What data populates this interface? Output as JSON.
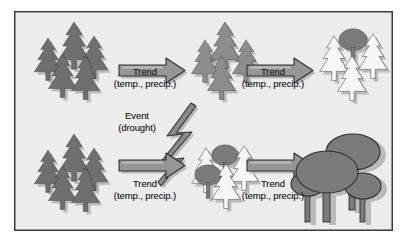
{
  "figure": {
    "panel_background": "#ececed",
    "border_color": "#3b3b3b"
  },
  "colors": {
    "dark_conifer": "#6f6f6f",
    "mid_conifer": "#8d8d8d",
    "white_conifer": "#f6f6f6",
    "deciduous": "#7b7b7b",
    "arrow": "#8f8f8f",
    "bolt": "#8a8a8a",
    "outline": "#2e2e2e",
    "shadow": "#b9b9b9",
    "text": "#1b1b1b"
  },
  "labels": {
    "trend_line1": "Trend",
    "trend_line2": "(temp., precip.)",
    "event_line1": "Event",
    "event_line2": "(drought)"
  },
  "arrows": [
    {
      "id": "arrow-top-left",
      "label_line1": "Trend",
      "label_line2": "(temp., precip.)"
    },
    {
      "id": "arrow-top-right",
      "label_line1": "Trend",
      "label_line2": "(temp., precip.)"
    },
    {
      "id": "arrow-bottom-left",
      "label_line1": "Trend",
      "label_line2": "(temp., precip.)"
    },
    {
      "id": "arrow-bottom-right",
      "label_line1": "Trend",
      "label_line2": "(temp., precip.)"
    }
  ],
  "stands": [
    {
      "id": "stand-top-left",
      "position": "top-left",
      "description": "dense dark conifer stand",
      "conifer_count": 5,
      "deciduous_count": 0,
      "shade": "dark"
    },
    {
      "id": "stand-top-middle",
      "position": "top-middle",
      "description": "conifer stand, lighter shade",
      "conifer_count": 4,
      "deciduous_count": 0,
      "shade": "mid"
    },
    {
      "id": "stand-top-right",
      "position": "top-right",
      "description": "white conifers with one deciduous tree",
      "conifer_count": 4,
      "deciduous_count": 1,
      "shade": "white"
    },
    {
      "id": "stand-bottom-left",
      "position": "bottom-left",
      "description": "dense dark conifer stand",
      "conifer_count": 5,
      "deciduous_count": 0,
      "shade": "dark"
    },
    {
      "id": "stand-bottom-middle",
      "position": "bottom-middle",
      "description": "white conifers with two deciduous trees",
      "conifer_count": 3,
      "deciduous_count": 2,
      "shade": "white"
    },
    {
      "id": "stand-bottom-right",
      "position": "bottom-right",
      "description": "deciduous broadleaf stand",
      "conifer_count": 0,
      "deciduous_count": 4,
      "shade": "deciduous"
    }
  ],
  "event": {
    "id": "drought-event",
    "line1": "Event",
    "line2": "(drought)",
    "symbol": "lightning-bolt"
  }
}
